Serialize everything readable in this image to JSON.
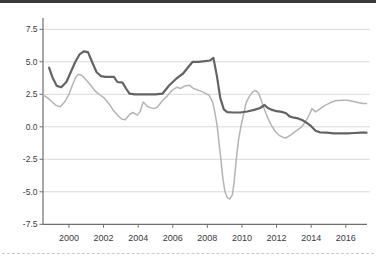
{
  "chart_data": {
    "type": "line",
    "title": "",
    "xlabel": "",
    "ylabel": "",
    "grid": true,
    "legend": "none",
    "colors": {
      "grid": "#d9d9d9",
      "axis": "#6e6e6e",
      "tick_label": "#3b3b3b",
      "top_border": "#3a3a3a",
      "bottom_separator": "#c9c9c9"
    },
    "plot": {
      "left": 43,
      "right": 370,
      "top": 18,
      "bottom": 224.3,
      "axis_right": 367
    },
    "x_axis": {
      "range": [
        1998.5,
        2017.4
      ],
      "ticks": [
        2000,
        2002,
        2004,
        2006,
        2008,
        2010,
        2012,
        2014,
        2016
      ],
      "tick_labels": [
        "2000",
        "2002",
        "2004",
        "2006",
        "2008",
        "2010",
        "2012",
        "2014",
        "2016"
      ]
    },
    "y_axis": {
      "range": [
        -7.5,
        8.37
      ],
      "ticks": [
        7.5,
        5.0,
        2.5,
        0.0,
        -2.5,
        -5.0,
        -7.5
      ],
      "tick_labels": [
        "7.5",
        "5.0",
        "2.5",
        "0.0",
        "-2.5",
        "-5.0",
        "-7.5"
      ]
    },
    "series": [
      {
        "id": "light",
        "name": "light-gray-line",
        "color": "#b4b4b4",
        "stroke_width": 1.5,
        "points": [
          [
            1998.5,
            2.45
          ],
          [
            1998.75,
            2.25
          ],
          [
            1999.0,
            1.95
          ],
          [
            1999.25,
            1.65
          ],
          [
            1999.5,
            1.55
          ],
          [
            1999.75,
            1.9
          ],
          [
            2000.0,
            2.5
          ],
          [
            2000.2,
            3.2
          ],
          [
            2000.4,
            3.85
          ],
          [
            2000.55,
            4.05
          ],
          [
            2000.75,
            3.95
          ],
          [
            2001.0,
            3.6
          ],
          [
            2001.25,
            3.2
          ],
          [
            2001.55,
            2.7
          ],
          [
            2001.8,
            2.45
          ],
          [
            2002.05,
            2.2
          ],
          [
            2002.3,
            1.8
          ],
          [
            2002.55,
            1.3
          ],
          [
            2002.8,
            0.9
          ],
          [
            2003.05,
            0.6
          ],
          [
            2003.25,
            0.55
          ],
          [
            2003.5,
            0.95
          ],
          [
            2003.7,
            1.1
          ],
          [
            2003.95,
            0.9
          ],
          [
            2004.1,
            1.15
          ],
          [
            2004.3,
            1.9
          ],
          [
            2004.55,
            1.55
          ],
          [
            2004.9,
            1.4
          ],
          [
            2005.1,
            1.5
          ],
          [
            2005.4,
            2.0
          ],
          [
            2005.7,
            2.4
          ],
          [
            2005.95,
            2.8
          ],
          [
            2006.25,
            3.05
          ],
          [
            2006.45,
            2.95
          ],
          [
            2006.7,
            3.15
          ],
          [
            2006.95,
            3.2
          ],
          [
            2007.2,
            2.95
          ],
          [
            2007.5,
            2.8
          ],
          [
            2007.8,
            2.65
          ],
          [
            2008.1,
            2.42
          ],
          [
            2008.3,
            1.9
          ],
          [
            2008.42,
            1.2
          ],
          [
            2008.55,
            0.2
          ],
          [
            2008.67,
            -1.2
          ],
          [
            2008.78,
            -2.5
          ],
          [
            2008.9,
            -4.0
          ],
          [
            2009.02,
            -5.0
          ],
          [
            2009.15,
            -5.45
          ],
          [
            2009.3,
            -5.55
          ],
          [
            2009.45,
            -5.2
          ],
          [
            2009.55,
            -4.2
          ],
          [
            2009.67,
            -2.5
          ],
          [
            2009.8,
            -1.0
          ],
          [
            2009.95,
            0.1
          ],
          [
            2010.1,
            1.0
          ],
          [
            2010.25,
            1.9
          ],
          [
            2010.45,
            2.4
          ],
          [
            2010.6,
            2.65
          ],
          [
            2010.78,
            2.8
          ],
          [
            2010.95,
            2.6
          ],
          [
            2011.1,
            2.1
          ],
          [
            2011.2,
            1.7
          ],
          [
            2011.45,
            0.8
          ],
          [
            2011.7,
            0.1
          ],
          [
            2011.95,
            -0.4
          ],
          [
            2012.15,
            -0.65
          ],
          [
            2012.35,
            -0.8
          ],
          [
            2012.55,
            -0.85
          ],
          [
            2012.85,
            -0.6
          ],
          [
            2013.15,
            -0.3
          ],
          [
            2013.45,
            0.0
          ],
          [
            2013.7,
            0.45
          ],
          [
            2013.9,
            0.95
          ],
          [
            2014.05,
            1.4
          ],
          [
            2014.25,
            1.15
          ],
          [
            2014.55,
            1.42
          ],
          [
            2014.8,
            1.65
          ],
          [
            2015.1,
            1.85
          ],
          [
            2015.4,
            2.0
          ],
          [
            2015.75,
            2.05
          ],
          [
            2016.1,
            2.05
          ],
          [
            2016.45,
            1.95
          ],
          [
            2016.75,
            1.85
          ],
          [
            2017.0,
            1.8
          ],
          [
            2017.2,
            1.8
          ]
        ]
      },
      {
        "id": "dark",
        "name": "dark-gray-line",
        "color": "#636363",
        "stroke_width": 2.2,
        "points": [
          [
            1998.85,
            4.55
          ],
          [
            1999.05,
            3.8
          ],
          [
            1999.3,
            3.15
          ],
          [
            1999.55,
            3.05
          ],
          [
            1999.85,
            3.45
          ],
          [
            2000.1,
            4.2
          ],
          [
            2000.35,
            4.95
          ],
          [
            2000.6,
            5.55
          ],
          [
            2000.85,
            5.8
          ],
          [
            2001.1,
            5.75
          ],
          [
            2001.35,
            4.95
          ],
          [
            2001.6,
            4.2
          ],
          [
            2001.85,
            3.9
          ],
          [
            2002.1,
            3.85
          ],
          [
            2002.35,
            3.85
          ],
          [
            2002.6,
            3.85
          ],
          [
            2002.8,
            3.45
          ],
          [
            2003.1,
            3.4
          ],
          [
            2003.3,
            2.95
          ],
          [
            2003.5,
            2.55
          ],
          [
            2003.8,
            2.5
          ],
          [
            2004.2,
            2.5
          ],
          [
            2004.6,
            2.5
          ],
          [
            2005.0,
            2.5
          ],
          [
            2005.4,
            2.55
          ],
          [
            2005.8,
            3.2
          ],
          [
            2006.2,
            3.7
          ],
          [
            2006.6,
            4.1
          ],
          [
            2006.9,
            4.6
          ],
          [
            2007.15,
            5.0
          ],
          [
            2007.5,
            5.0
          ],
          [
            2007.85,
            5.05
          ],
          [
            2008.15,
            5.1
          ],
          [
            2008.35,
            5.3
          ],
          [
            2008.55,
            3.9
          ],
          [
            2008.75,
            2.2
          ],
          [
            2008.95,
            1.35
          ],
          [
            2009.15,
            1.12
          ],
          [
            2009.5,
            1.1
          ],
          [
            2009.9,
            1.1
          ],
          [
            2010.3,
            1.18
          ],
          [
            2010.7,
            1.3
          ],
          [
            2011.05,
            1.45
          ],
          [
            2011.3,
            1.68
          ],
          [
            2011.5,
            1.45
          ],
          [
            2011.75,
            1.3
          ],
          [
            2012.0,
            1.2
          ],
          [
            2012.3,
            1.15
          ],
          [
            2012.55,
            1.05
          ],
          [
            2012.75,
            0.8
          ],
          [
            2013.0,
            0.7
          ],
          [
            2013.25,
            0.65
          ],
          [
            2013.5,
            0.5
          ],
          [
            2013.75,
            0.3
          ],
          [
            2014.0,
            0.05
          ],
          [
            2014.25,
            -0.3
          ],
          [
            2014.5,
            -0.42
          ],
          [
            2014.9,
            -0.45
          ],
          [
            2015.3,
            -0.5
          ],
          [
            2015.7,
            -0.5
          ],
          [
            2016.1,
            -0.5
          ],
          [
            2016.5,
            -0.48
          ],
          [
            2016.9,
            -0.45
          ],
          [
            2017.2,
            -0.45
          ]
        ]
      }
    ]
  }
}
